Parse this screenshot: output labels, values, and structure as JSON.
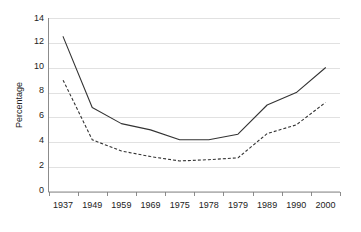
{
  "chart_data": {
    "type": "line",
    "title": "",
    "xlabel": "",
    "ylabel": "Percentage",
    "categories": [
      "1937",
      "1949",
      "1959",
      "1969",
      "1975",
      "1978",
      "1979",
      "1989",
      "1990",
      "2000"
    ],
    "ylim": [
      0,
      14
    ],
    "yticks": [
      "0",
      "2",
      "4",
      "6",
      "8",
      "10",
      "12",
      "14"
    ],
    "grid": "horizontal",
    "legend": "none",
    "series": [
      {
        "name": "solid-line",
        "style": "solid",
        "values": [
          12.5,
          6.8,
          5.5,
          5.0,
          4.2,
          4.2,
          4.65,
          7.0,
          8.0,
          10.0
        ]
      },
      {
        "name": "dashed-line",
        "style": "dashed",
        "values": [
          9.0,
          4.2,
          3.3,
          2.85,
          2.5,
          2.6,
          2.75,
          4.7,
          5.4,
          7.2
        ]
      }
    ]
  },
  "axis": {
    "y_title": "Percentage",
    "y_tick_0": "0",
    "y_tick_1": "2",
    "y_tick_2": "4",
    "y_tick_3": "6",
    "y_tick_4": "8",
    "y_tick_5": "10",
    "y_tick_6": "12",
    "y_tick_7": "14",
    "x_tick_0": "1937",
    "x_tick_1": "1949",
    "x_tick_2": "1959",
    "x_tick_3": "1969",
    "x_tick_4": "1975",
    "x_tick_5": "1978",
    "x_tick_6": "1979",
    "x_tick_7": "1989",
    "x_tick_8": "1990",
    "x_tick_9": "2000"
  },
  "colors": {
    "line": "#333333",
    "grid": "#d9d9d9",
    "axis": "#7f7f7f",
    "text": "#222222",
    "background": "#ffffff"
  }
}
